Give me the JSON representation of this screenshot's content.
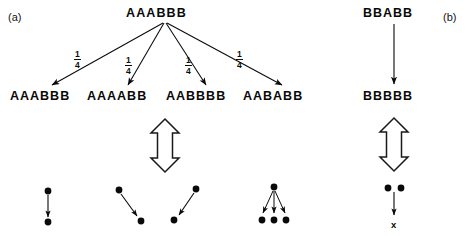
{
  "figure": {
    "width": 474,
    "height": 236,
    "background": "#ffffff",
    "ink": "#090909"
  },
  "panels": [
    {
      "id": "a",
      "label": "(a)",
      "root": {
        "text": "AAABBB"
      },
      "branch_probability_numerator": "1",
      "branch_probability_denominator": "4",
      "branches": [
        {
          "label": "1/4",
          "numerator": "1",
          "denominator": "4",
          "target": "AAABBB"
        },
        {
          "label": "1/4",
          "numerator": "1",
          "denominator": "4",
          "target": "AAAABB"
        },
        {
          "label": "1/4",
          "numerator": "1",
          "denominator": "4",
          "target": "AABBBB"
        },
        {
          "label": "1/4",
          "numerator": "1",
          "denominator": "4",
          "target": "AABABB"
        }
      ],
      "children": [
        {
          "text": "AAABBB"
        },
        {
          "text": "AAAABB"
        },
        {
          "text": "AABBBB"
        },
        {
          "text": "AABABB"
        }
      ],
      "equivalence_arrow": "hollow-double-headed-vertical-arrow",
      "graphs": [
        {
          "name": "one-to-one-vertical",
          "top_dots": 1,
          "bottom_dots": 1,
          "arrows": 1
        },
        {
          "name": "one-to-one-diagonal-right",
          "top_dots": 1,
          "bottom_dots": 1,
          "arrows": 1
        },
        {
          "name": "one-to-one-diagonal-left",
          "top_dots": 1,
          "bottom_dots": 1,
          "arrows": 1
        },
        {
          "name": "one-to-three-fan",
          "top_dots": 1,
          "bottom_dots": 3,
          "arrows": 3
        }
      ]
    },
    {
      "id": "b",
      "label": "(b)",
      "root": {
        "text": "BBABB"
      },
      "child": {
        "text": "BBBBB"
      },
      "equivalence_arrow": "hollow-double-headed-vertical-arrow",
      "graph": {
        "name": "two-dots-to-x",
        "top_dots": 2,
        "arrows": 1,
        "terminal_label": "x"
      }
    }
  ]
}
